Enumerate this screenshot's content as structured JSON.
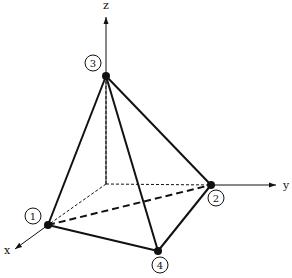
{
  "diagram": {
    "axes": {
      "x": {
        "label": "x"
      },
      "y": {
        "label": "y"
      },
      "z": {
        "label": "z"
      }
    },
    "nodes": [
      {
        "id": "1",
        "label": "1"
      },
      {
        "id": "2",
        "label": "2"
      },
      {
        "id": "3",
        "label": "3"
      },
      {
        "id": "4",
        "label": "4"
      }
    ],
    "edges": {
      "solid": [
        [
          "1",
          "3"
        ],
        [
          "3",
          "2"
        ],
        [
          "3",
          "4"
        ],
        [
          "1",
          "4"
        ],
        [
          "4",
          "2"
        ]
      ],
      "dashed": [
        [
          "1",
          "2"
        ]
      ]
    },
    "colors": {
      "line": "#111111",
      "background": "#ffffff"
    }
  }
}
